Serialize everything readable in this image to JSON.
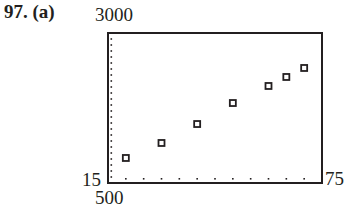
{
  "problem": {
    "number": "97.",
    "part": "(a)"
  },
  "window": {
    "xmin_label": "15",
    "xmax_label": "75",
    "ymin_label": "500",
    "ymax_label": "3000"
  },
  "chart_data": {
    "type": "scatter",
    "title": "",
    "xlabel": "",
    "ylabel": "",
    "xlim": [
      15,
      75
    ],
    "ylim": [
      500,
      3000
    ],
    "x_tick_step": 5,
    "y_tick_step": 100,
    "grid": false,
    "x": [
      20,
      30,
      40,
      50,
      60,
      65,
      70
    ],
    "y": [
      917,
      1167,
      1483,
      1833,
      2117,
      2267,
      2417
    ],
    "marker": "open-square",
    "color": "#231f20"
  }
}
